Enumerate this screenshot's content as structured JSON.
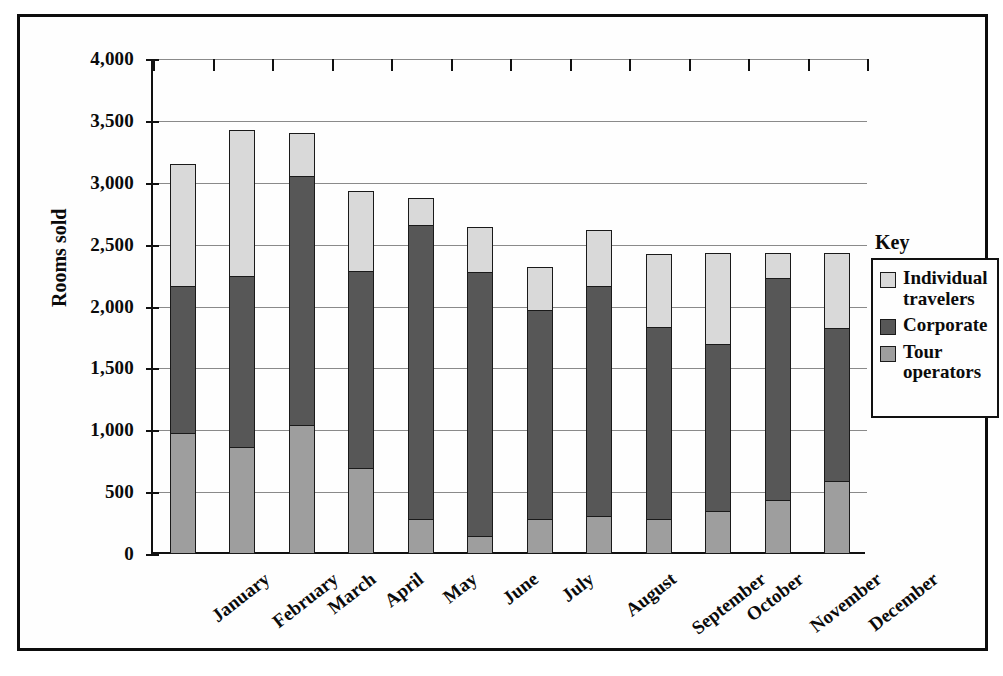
{
  "chart_data": {
    "type": "bar",
    "subtype": "stacked-vertical",
    "title": "",
    "xlabel": "",
    "ylabel": "Rooms sold",
    "ylim": [
      0,
      4000
    ],
    "ytick_step": 500,
    "ytick_labels": [
      "4,000",
      "3,500",
      "3,000",
      "2,500",
      "2,000",
      "1,500",
      "1,000",
      "500",
      "0"
    ],
    "ytick_values": [
      4000,
      3500,
      3000,
      2500,
      2000,
      1500,
      1000,
      500,
      0
    ],
    "grid": true,
    "grid_axis": "y",
    "legend_position": "right",
    "legend_title": "Key",
    "categories": [
      "January",
      "February",
      "March",
      "April",
      "May",
      "June",
      "July",
      "August",
      "September",
      "October",
      "November",
      "December"
    ],
    "stack_order_bottom_to_top": [
      "Tour operators",
      "Corporate",
      "Individual travelers"
    ],
    "series": [
      {
        "name": "Tour operators",
        "color": "#9e9e9e",
        "values": [
          975,
          860,
          1035,
          690,
          280,
          145,
          280,
          300,
          280,
          340,
          430,
          585
        ]
      },
      {
        "name": "Corporate",
        "color": "#575757",
        "values": [
          1195,
          1395,
          2030,
          1605,
          2385,
          2140,
          1700,
          1870,
          1565,
          1365,
          1810,
          1250
        ]
      },
      {
        "name": "Individual travelers",
        "color": "#d9d9d9",
        "values": [
          1005,
          1190,
          355,
          660,
          235,
          375,
          360,
          465,
          600,
          745,
          210,
          615
        ]
      }
    ],
    "cumulative_tops": {
      "tour_operators": [
        975,
        860,
        1035,
        690,
        280,
        145,
        280,
        300,
        280,
        340,
        430,
        585
      ],
      "corporate": [
        2170,
        2255,
        3065,
        2295,
        2665,
        2285,
        1980,
        2170,
        1845,
        1705,
        2240,
        1835
      ],
      "total": [
        3175,
        3445,
        3420,
        2955,
        2900,
        2660,
        2340,
        2635,
        2445,
        2450,
        2450,
        2450
      ]
    }
  },
  "axis": {
    "y_title": "Rooms sold"
  },
  "legend": {
    "title": "Key",
    "items": [
      {
        "label": "Individual travelers",
        "color": "#d9d9d9",
        "swatch_name": "legend-swatch-individual-travelers"
      },
      {
        "label": "Corporate",
        "color": "#575757",
        "swatch_name": "legend-swatch-corporate"
      },
      {
        "label": "Tour operators",
        "color": "#9e9e9e",
        "swatch_name": "legend-swatch-tour-operators"
      }
    ]
  }
}
